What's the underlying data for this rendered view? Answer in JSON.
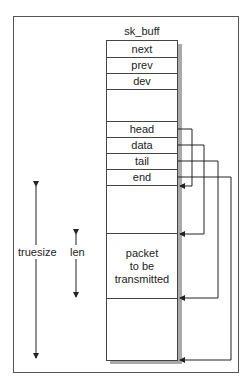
{
  "diagram": {
    "title": "sk_buff",
    "fields": [
      {
        "label": "next"
      },
      {
        "label": "prev"
      },
      {
        "label": "dev"
      },
      {
        "label": ""
      },
      {
        "label": "head"
      },
      {
        "label": "data"
      },
      {
        "label": "tail"
      },
      {
        "label": "end"
      }
    ],
    "buffer_regions": [
      {
        "label": "",
        "role": "headroom"
      },
      {
        "label": "packet\nto be\ntransmitted",
        "role": "packet"
      },
      {
        "label": "",
        "role": "tailroom"
      }
    ],
    "packet_label_lines": [
      "packet",
      "to be",
      "transmitted"
    ],
    "pointers": [
      {
        "from": "head",
        "to": "start of headroom"
      },
      {
        "from": "data",
        "to": "start of packet"
      },
      {
        "from": "tail",
        "to": "end of packet"
      },
      {
        "from": "end",
        "to": "end of buffer"
      }
    ],
    "measures": [
      {
        "label": "truesize",
        "spans": "entire buffer"
      },
      {
        "label": "len",
        "spans": "packet"
      }
    ],
    "colors": {
      "line": "#333333",
      "shadow": "#aaaaaa",
      "background": "#ffffff"
    }
  }
}
